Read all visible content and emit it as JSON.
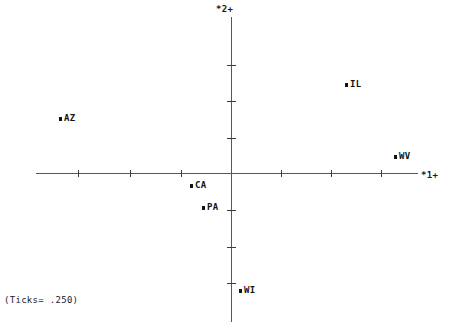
{
  "chart_data": {
    "type": "scatter",
    "title": "",
    "subtitle": "",
    "xlabel": "*1+",
    "ylabel": "*2+",
    "annotation": "(Ticks= .250)",
    "tick_interval": 0.25,
    "grid": false,
    "legend": "none",
    "xlim": [
      -0.97,
      0.92
    ],
    "ylim": [
      -0.86,
      1.07
    ],
    "xticks": [
      -0.75,
      -0.5,
      -0.25,
      0.25,
      0.5,
      0.75
    ],
    "yticks": [
      -0.75,
      -0.5,
      -0.25,
      0.25,
      0.5,
      0.75
    ],
    "points": [
      {
        "label": "AZ",
        "x": -0.857,
        "y": 0.377,
        "px": 59,
        "py": 119
      },
      {
        "label": "IL",
        "x": 0.559,
        "y": 0.61,
        "px": 345,
        "py": 85
      },
      {
        "label": "WV",
        "x": 0.802,
        "y": 0.116,
        "px": 394,
        "py": 157
      },
      {
        "label": "CA",
        "x": -0.208,
        "y": -0.082,
        "px": 190,
        "py": 186
      },
      {
        "label": "PA",
        "x": -0.149,
        "y": -0.233,
        "px": 202,
        "py": 208
      },
      {
        "label": "WI",
        "x": 0.035,
        "y": -0.801,
        "px": 239,
        "py": 291
      }
    ],
    "axes": {
      "origin_px": {
        "x": 232,
        "y": 174
      },
      "x_tick_px": [
        78,
        130,
        181,
        281,
        331,
        381
      ],
      "y_tick_px": [
        65,
        101,
        138,
        210,
        247,
        283
      ]
    },
    "colors": {
      "axis": "#55575a",
      "tick": "#3a3c3e",
      "marker": "#111213",
      "text": "#1b1c1d",
      "background": "#ffffff"
    }
  }
}
